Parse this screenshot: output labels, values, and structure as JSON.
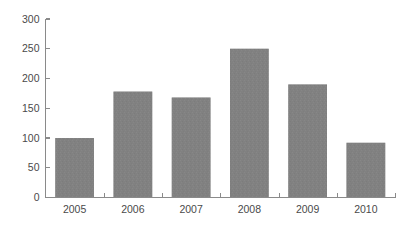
{
  "chart_data": {
    "type": "bar",
    "title": "",
    "subtitle": "",
    "xlabel": "",
    "ylabel": "",
    "categories": [
      "2005",
      "2006",
      "2007",
      "2008",
      "2009",
      "2010"
    ],
    "values": [
      100,
      178,
      168,
      250,
      190,
      92
    ],
    "series": [
      {
        "name": "",
        "values": [
          100,
          178,
          168,
          250,
          190,
          92
        ]
      }
    ],
    "ylim": [
      0,
      300
    ],
    "y_ticks": [
      0,
      50,
      100,
      150,
      200,
      250,
      300
    ],
    "y_tick_labels": [
      "0",
      "50",
      "100",
      "150",
      "200",
      "250",
      "300"
    ],
    "x_tick_labels": [
      "2005",
      "2006",
      "2007",
      "2008",
      "2009",
      "2010"
    ],
    "grid": false,
    "legend": false,
    "legend_position": "none",
    "annotations": [],
    "bar_color": "#818181",
    "axis_color": "#8a8a8a",
    "label_color": "#4a4a4a",
    "background_color": "#ffffff"
  }
}
